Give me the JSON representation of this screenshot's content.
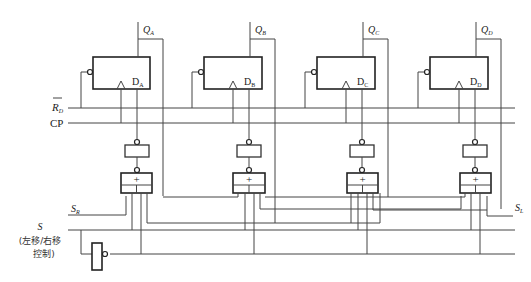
{
  "diagram": {
    "flip_flops": [
      {
        "output": "Q",
        "output_sub": "A",
        "input": "D",
        "input_sub": "A"
      },
      {
        "output": "Q",
        "output_sub": "B",
        "input": "D",
        "input_sub": "B"
      },
      {
        "output": "Q",
        "output_sub": "C",
        "input": "D",
        "input_sub": "C"
      },
      {
        "output": "Q",
        "output_sub": "D",
        "input": "D",
        "input_sub": "D"
      }
    ],
    "signals": {
      "reset": "R",
      "reset_sub": "D",
      "clock": "CP",
      "serial_right": "S",
      "serial_right_sub": "R",
      "serial_left": "S",
      "serial_left_sub": "L",
      "select": "S",
      "select_note_line1": "(左移/右移",
      "select_note_line2": "控制)"
    },
    "gate_symbol": "+"
  }
}
